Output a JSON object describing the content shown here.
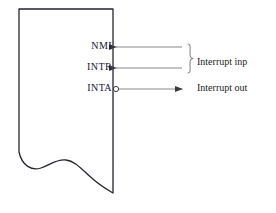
{
  "diagram": {
    "chip_block": {
      "name": "processor-block",
      "description": "Partial rectangle with torn bottom edge",
      "edge_color": "#25252f",
      "fill_color": "#ffffff"
    },
    "pins": [
      {
        "id": "nmi",
        "label": "NMI",
        "direction": "input",
        "arrow": "left",
        "inverted": false
      },
      {
        "id": "intr",
        "label": "INTR",
        "direction": "input",
        "arrow": "left",
        "inverted": false
      },
      {
        "id": "inta",
        "label": "INTA",
        "direction": "output",
        "arrow": "right",
        "inverted": true
      }
    ],
    "annotations": [
      {
        "id": "interrupt-inputs",
        "text": "Interrupt inp",
        "brace": true
      },
      {
        "id": "interrupt-output",
        "text": "Interrupt out",
        "brace": false
      }
    ],
    "colors": {
      "outline": "#25252f",
      "signal_line": "#8a8a90",
      "arrowhead": "#3b3b42",
      "pin_label_text": "#14143c",
      "annotation_text": "#1a1a1a",
      "background": "#ffffff"
    }
  }
}
